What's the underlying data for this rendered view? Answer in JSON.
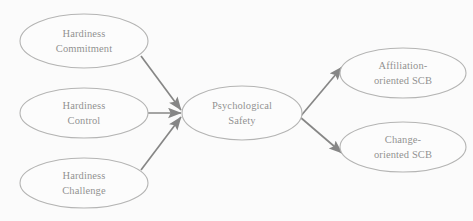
{
  "figure": {
    "type": "path-diagram",
    "background_color": "#fdfdfd",
    "node_stroke_color": "#6d6d6d",
    "node_fill_color": "#ffffff",
    "arrow_color": "#111111",
    "text_color": "#1b1b1b"
  },
  "nodes": [
    {
      "id": "hardiness-commitment",
      "line1": "Hardiness",
      "line2": "Commitment",
      "cx": 84,
      "cy": 41,
      "rx": 64,
      "ry": 27
    },
    {
      "id": "hardiness-control",
      "line1": "Hardiness",
      "line2": "Control",
      "cx": 84,
      "cy": 113,
      "rx": 64,
      "ry": 25
    },
    {
      "id": "hardiness-challenge",
      "line1": "Hardiness",
      "line2": "Challenge",
      "cx": 84,
      "cy": 183,
      "rx": 64,
      "ry": 25
    },
    {
      "id": "psychological-safety",
      "line1": "Psychological",
      "line2": "Safety",
      "cx": 242,
      "cy": 113,
      "rx": 60,
      "ry": 27
    },
    {
      "id": "affiliation-oriented-scb",
      "line1": "Affiliation-",
      "line2": "oriented SCB",
      "cx": 403,
      "cy": 73,
      "rx": 63,
      "ry": 25
    },
    {
      "id": "change-oriented-scb",
      "line1": "Change-",
      "line2": "oriented SCB",
      "cx": 403,
      "cy": 147,
      "rx": 63,
      "ry": 25
    }
  ],
  "edges": [
    {
      "id": "commitment-to-safety",
      "from": "hardiness-commitment",
      "to": "psychological-safety",
      "x1": 141,
      "y1": 56,
      "x2": 181,
      "y2": 110
    },
    {
      "id": "control-to-safety",
      "from": "hardiness-control",
      "to": "psychological-safety",
      "x1": 148,
      "y1": 113,
      "x2": 181,
      "y2": 113
    },
    {
      "id": "challenge-to-safety",
      "from": "hardiness-challenge",
      "to": "psychological-safety",
      "x1": 141,
      "y1": 170,
      "x2": 181,
      "y2": 117
    },
    {
      "id": "safety-to-affiliation",
      "from": "psychological-safety",
      "to": "affiliation-oriented-scb",
      "x1": 300,
      "y1": 117,
      "x2": 342,
      "y2": 67
    },
    {
      "id": "safety-to-change",
      "from": "psychological-safety",
      "to": "change-oriented-scb",
      "x1": 300,
      "y1": 117,
      "x2": 342,
      "y2": 153
    }
  ]
}
